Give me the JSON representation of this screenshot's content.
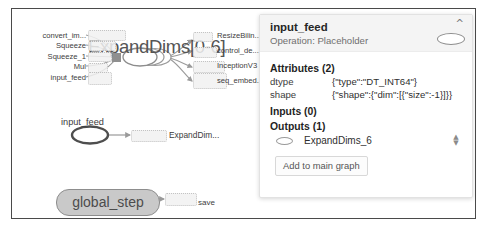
{
  "graph": {
    "series_node": {
      "title": "ExpandDims[0-6]",
      "inputs": [
        "convert_im...",
        "Squeeze",
        "Squeeze_1",
        "Mul",
        "input_feed"
      ],
      "outputs": [
        "ResizeBilin...",
        "control_de...",
        "InceptionV3",
        "seq_embed..."
      ]
    },
    "selected_node": {
      "caption": "input_feed",
      "target": "ExpandDim..."
    },
    "global_step_node": {
      "label": "global_step",
      "edge_label": "save"
    },
    "colors": {
      "node_fill": "#c9c9c9",
      "node_stroke": "#8d8d8d",
      "edge": "#9a9a9a",
      "frame": "#4a4a4a"
    }
  },
  "panel": {
    "title": "input_feed",
    "subtitle": "Operation: Placeholder",
    "collapse_icon": "chevron-up",
    "attributes": {
      "heading": "Attributes (2)",
      "rows": [
        {
          "key": "dtype",
          "value": "{\"type\":\"DT_INT64\"}"
        },
        {
          "key": "shape",
          "value": "{\"shape\":{\"dim\":[{\"size\":-1}]}}"
        }
      ]
    },
    "inputs": {
      "heading": "Inputs (0)",
      "rows": []
    },
    "outputs": {
      "heading": "Outputs (1)",
      "rows": [
        {
          "name": "ExpandDims_6"
        }
      ]
    },
    "add_button": "Add to main graph"
  }
}
